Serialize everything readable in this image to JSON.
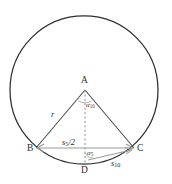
{
  "figure": {
    "colors": {
      "circle_stroke": "#2e2e2e",
      "triangle_stroke": "#4a4a4a",
      "chord_arrow": "#9a9a9a",
      "dashed_line": "#8d8d8d",
      "label_text": "#2b2b2b"
    },
    "geometry": {
      "circle_center_x": 84,
      "circle_center_y": 90,
      "circle_radius": 74,
      "apex_x": 85,
      "apex_y": 90,
      "left_vertex_x": 36,
      "left_vertex_y": 148,
      "right_vertex_x": 134,
      "right_vertex_y": 148,
      "foot_x": 85,
      "foot_y": 164
    }
  },
  "points": {
    "apex": "A",
    "left": "B",
    "right": "C",
    "foot": "D"
  },
  "labels": {
    "radius": "r",
    "radius_full": "r",
    "half_side_base": "s",
    "half_side_sub": "5",
    "half_side_tail": "/2",
    "half_side_full": "s5/2",
    "decagon_side_base": "s",
    "decagon_side_sub": "10",
    "decagon_side_full": "s10",
    "angle_apex_base": "α",
    "angle_apex_sub": "10",
    "angle_apex_full": "α10",
    "angle_foot_base": "α",
    "angle_foot_sub": "5",
    "angle_foot_full": "α5"
  }
}
